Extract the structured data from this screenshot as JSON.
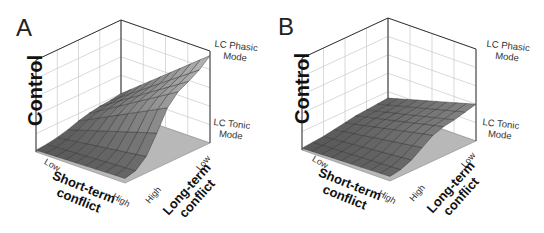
{
  "chart_data": [
    {
      "type": "surface3d",
      "panel": "A",
      "zlabel": "Control",
      "xlabel": "Short-term conflict",
      "ylabel": "Long-term conflict",
      "x_ticks": [
        "Low",
        "High"
      ],
      "y_ticks": [
        "Low",
        "High"
      ],
      "z_annotations": [
        "LC Tonic Mode",
        "LC Phasic Mode"
      ],
      "grid": true,
      "description": "Control rises sigmoidally with short-term conflict; plateau reaches near LC Phasic Mode level at low long-term conflict and drops toward LC Tonic Mode at high long-term conflict",
      "z_grid_low_long": [
        0.05,
        0.08,
        0.18,
        0.38,
        0.6,
        0.72,
        0.78,
        0.85,
        0.95
      ],
      "z_grid_high_long": [
        0.02,
        0.03,
        0.05,
        0.08,
        0.12,
        0.15,
        0.17,
        0.18,
        0.2
      ]
    },
    {
      "type": "surface3d",
      "panel": "B",
      "zlabel": "Control",
      "xlabel": "Short-term conflict",
      "ylabel": "Long-term conflict",
      "x_ticks": [
        "Low",
        "High"
      ],
      "y_ticks": [
        "Low",
        "High"
      ],
      "z_annotations": [
        "LC Tonic Mode",
        "LC Phasic Mode"
      ],
      "grid": true,
      "description": "Flatter surface: control rises modestly with short-term conflict, plateau remains below LC Tonic Mode level",
      "z_grid_low_long": [
        0.05,
        0.07,
        0.12,
        0.2,
        0.28,
        0.32,
        0.34,
        0.37,
        0.4
      ],
      "z_grid_high_long": [
        0.02,
        0.03,
        0.04,
        0.06,
        0.08,
        0.1,
        0.11,
        0.12,
        0.13
      ]
    }
  ],
  "panels": [
    {
      "letter": "A",
      "zlabel": "Control",
      "phasic": [
        "LC Phasic",
        "Mode"
      ],
      "tonic": [
        "LC Tonic",
        "Mode"
      ],
      "short_low": "Low",
      "short_high": "High",
      "long_low": "Low",
      "long_high": "High",
      "short_title": [
        "Short-term",
        "conflict"
      ],
      "long_title": [
        "Long-term",
        "conflict"
      ]
    },
    {
      "letter": "B",
      "zlabel": "Control",
      "phasic": [
        "LC Phasic",
        "Mode"
      ],
      "tonic": [
        "LC Tonic",
        "Mode"
      ],
      "short_low": "Low",
      "short_high": "High",
      "long_low": "Low",
      "long_high": "High",
      "short_title": [
        "Short-term",
        "conflict"
      ],
      "long_title": [
        "Long-term",
        "conflict"
      ]
    }
  ]
}
